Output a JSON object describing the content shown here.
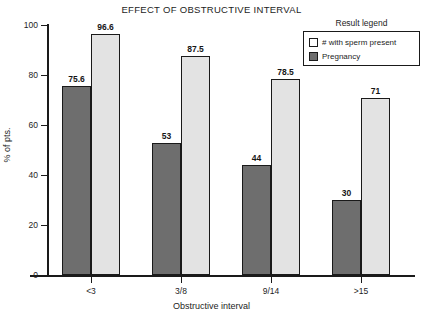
{
  "chart_data": {
    "type": "bar",
    "title": "EFFECT OF OBSTRUCTIVE INTERVAL",
    "xlabel": "Obstructive interval",
    "ylabel": "% of pts.",
    "categories": [
      "<3",
      "3/8",
      "9/14",
      ">15"
    ],
    "series": [
      {
        "name": "# with sperm present",
        "values": [
          96.6,
          87.5,
          78.5,
          71
        ],
        "value_labels": [
          "96.6",
          "87.5",
          "78.5",
          "71"
        ],
        "color": "#e3e3e3"
      },
      {
        "name": "Pregnancy",
        "values": [
          75.6,
          53,
          44,
          30
        ],
        "value_labels": [
          "75.6",
          "53",
          "44",
          "30"
        ],
        "color": "#6e6e6e"
      }
    ],
    "ylim": [
      0,
      100
    ],
    "yticks": [
      0,
      20,
      40,
      60,
      80,
      100
    ],
    "ytick_labels": [
      "0",
      "20",
      "40",
      "60",
      "80",
      "100"
    ],
    "grid": false,
    "legend": {
      "title": "Result legend",
      "position": "top-right",
      "entries": [
        "# with sperm present",
        "Pregnancy"
      ]
    }
  }
}
